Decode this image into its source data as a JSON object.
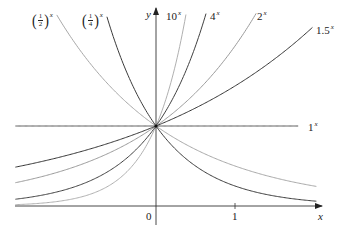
{
  "chart_data": {
    "type": "line",
    "title": "",
    "xlabel": "x",
    "ylabel": "y",
    "xlim": [
      -1.78,
      2.05
    ],
    "ylim": [
      -0.35,
      2.42
    ],
    "grid": false,
    "legend": "inline labels at curve ends",
    "x_ticks": [
      {
        "value": 0,
        "label": "0"
      },
      {
        "value": 1,
        "label": "1"
      }
    ],
    "series": [
      {
        "name": "(1/2)^x",
        "label_base": "1/2",
        "base": 0.5,
        "color": "#a8a8a8",
        "x_range": [
          -1.78,
          2.03
        ]
      },
      {
        "name": "(1/4)^x",
        "label_base": "1/4",
        "base": 0.25,
        "color": "#3a3a3a",
        "x_range": [
          -1.78,
          2.03
        ]
      },
      {
        "name": "10^x",
        "label_base": "10",
        "base": 10,
        "color": "#b0b0b0",
        "x_range": [
          -1.78,
          2.03
        ]
      },
      {
        "name": "4^x",
        "label_base": "4",
        "base": 4,
        "color": "#404040",
        "x_range": [
          -1.78,
          2.03
        ]
      },
      {
        "name": "2^x",
        "label_base": "2",
        "base": 2,
        "color": "#9a9a9a",
        "x_range": [
          -1.78,
          2.03
        ]
      },
      {
        "name": "1.5^x",
        "label_base": "1.5",
        "base": 1.5,
        "color": "#333333",
        "x_range": [
          -1.78,
          1.98
        ]
      },
      {
        "name": "1^x",
        "label_base": "1",
        "base": 1,
        "color": "#555555",
        "x_range": [
          -1.78,
          1.8
        ]
      }
    ],
    "annotations": [
      "All curves intersect at (0, 1)"
    ]
  },
  "labels": {
    "half": {
      "num": "1",
      "den": "2",
      "exp": "x"
    },
    "quarter": {
      "num": "1",
      "den": "4",
      "exp": "x"
    },
    "ten": {
      "base": "10",
      "exp": "x"
    },
    "four": {
      "base": "4",
      "exp": "x"
    },
    "two": {
      "base": "2",
      "exp": "x"
    },
    "onefive": {
      "base": "1.5",
      "exp": "x"
    },
    "one": {
      "base": "1",
      "exp": "x"
    },
    "x_axis": "x",
    "y_axis": "y",
    "tick0": "0",
    "tick1": "1",
    "lparen": "(",
    "rparen": ")"
  }
}
